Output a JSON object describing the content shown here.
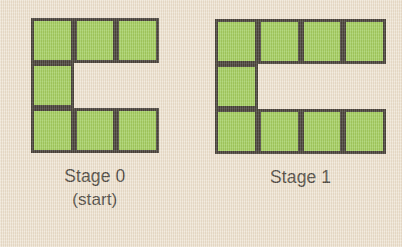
{
  "figure": {
    "background_color": "#ede2d0",
    "square_fill_color": "#8dc63f",
    "square_border_color": "#17120d",
    "text_color": "#1d1a16",
    "stages": [
      {
        "id": "stage-0",
        "label": "Stage 0",
        "sublabel": "(start)",
        "columns": 3,
        "rows": 3,
        "square_count": 7,
        "shape_name": "C",
        "filled_cells": [
          [
            0,
            0
          ],
          [
            0,
            1
          ],
          [
            0,
            2
          ],
          [
            1,
            0
          ],
          [
            2,
            0
          ],
          [
            2,
            1
          ],
          [
            2,
            2
          ]
        ],
        "origin_x": 31,
        "origin_y": 18,
        "cell_width": 42.5,
        "cell_height": 45
      },
      {
        "id": "stage-1",
        "label": "Stage 1",
        "sublabel": "",
        "columns": 4,
        "rows": 3,
        "square_count": 9,
        "shape_name": "C",
        "filled_cells": [
          [
            0,
            0
          ],
          [
            0,
            1
          ],
          [
            0,
            2
          ],
          [
            0,
            3
          ],
          [
            1,
            0
          ],
          [
            2,
            0
          ],
          [
            2,
            1
          ],
          [
            2,
            2
          ],
          [
            2,
            3
          ]
        ],
        "origin_x": 215,
        "origin_y": 19,
        "cell_width": 42.8,
        "cell_height": 45
      }
    ]
  }
}
